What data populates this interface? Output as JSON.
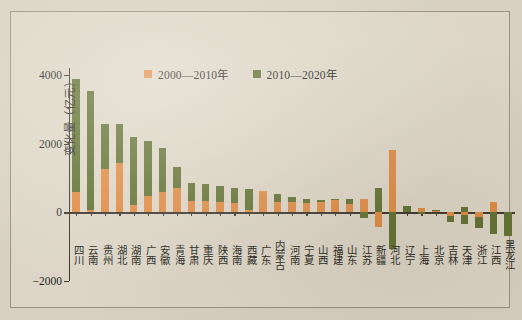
{
  "figure": {
    "background_color": "#ddd6c8",
    "orange": "#e08a42",
    "green": "#5f7031",
    "axis_color": "#3a352d"
  },
  "legend": {
    "position": "top-center",
    "items": [
      {
        "label": "2000—2010年",
        "color": "#e08a42",
        "swatch": "square-swatch"
      },
      {
        "label": "2010—2020年",
        "color": "#5f7031",
        "swatch": "square-swatch"
      }
    ]
  },
  "yaxis": {
    "label": "变化量（亿元）",
    "ticks": [
      "4000",
      "2000",
      "0",
      "-2000"
    ],
    "tick_values": [
      4000,
      2000,
      0,
      -2000
    ],
    "min": -2000,
    "max": 4200
  },
  "chart_data": {
    "type": "bar",
    "stacked": true,
    "title": "",
    "subtitle": "",
    "xlabel": "",
    "ylabel": "变化量（亿元）",
    "ylim": [
      -2000,
      4200
    ],
    "yticks": [
      -2000,
      0,
      2000,
      4000
    ],
    "grid": false,
    "legend_position": "top-center",
    "categories": [
      "四川",
      "云南",
      "贵州",
      "湖北",
      "湖南",
      "广西",
      "安徽",
      "青海",
      "甘肃",
      "重庆",
      "陕西",
      "海南",
      "西藏",
      "广东",
      "内蒙古",
      "河南",
      "宁夏",
      "山西",
      "福建",
      "山东",
      "江苏",
      "新疆",
      "河北",
      "辽宁",
      "上海",
      "北京",
      "吉林",
      "天津",
      "浙江",
      "江西",
      "黑龙江"
    ],
    "series": [
      {
        "name": "2000—2010年",
        "color": "#e08a42",
        "values": [
          600,
          80,
          1250,
          1430,
          200,
          480,
          600,
          700,
          330,
          330,
          290,
          260,
          60,
          620,
          310,
          300,
          280,
          310,
          350,
          250,
          390,
          0,
          1810,
          0,
          120,
          40,
          20,
          -80,
          -130,
          310,
          0
        ]
      },
      {
        "name": "2010—2020年",
        "color": "#5f7031",
        "values": [
          3270,
          3460,
          1310,
          1130,
          2000,
          1600,
          1280,
          620,
          860,
          780,
          620,
          330,
          680,
          0,
          220,
          150,
          100,
          40,
          50,
          130,
          -180,
          700,
          -850,
          180,
          -40,
          30,
          -160,
          -250,
          -500,
          -620,
          -540
        ]
      }
    ],
    "negative_values_note": "新疆 green value is positive above axis with additional negative extent; 江苏/河北 show negative green segments below zero"
  },
  "bars": [
    {
      "cat": "四川",
      "pos2000": 600,
      "pos2010": 3270,
      "neg2000": 0,
      "neg2010": 0
    },
    {
      "cat": "云南",
      "pos2000": 80,
      "pos2010": 3460,
      "neg2000": 0,
      "neg2010": 0
    },
    {
      "cat": "贵州",
      "pos2000": 1250,
      "pos2010": 1310,
      "neg2000": 0,
      "neg2010": 0
    },
    {
      "cat": "湖北",
      "pos2000": 1430,
      "pos2010": 1130,
      "neg2000": 0,
      "neg2010": 0
    },
    {
      "cat": "湖南",
      "pos2000": 200,
      "pos2010": 2000,
      "neg2000": 0,
      "neg2010": 0
    },
    {
      "cat": "广西",
      "pos2000": 480,
      "pos2010": 1600,
      "neg2000": 0,
      "neg2010": 0
    },
    {
      "cat": "安徽",
      "pos2000": 600,
      "pos2010": 1280,
      "neg2000": 0,
      "neg2010": 0
    },
    {
      "cat": "青海",
      "pos2000": 700,
      "pos2010": 620,
      "neg2000": 0,
      "neg2010": 0
    },
    {
      "cat": "甘肃",
      "pos2000": 330,
      "pos2010": 520,
      "neg2000": 0,
      "neg2010": 0
    },
    {
      "cat": "重庆",
      "pos2000": 330,
      "pos2010": 480,
      "neg2000": 0,
      "neg2010": 0
    },
    {
      "cat": "陕西",
      "pos2000": 290,
      "pos2010": 480,
      "neg2000": 0,
      "neg2010": 0
    },
    {
      "cat": "海南",
      "pos2000": 260,
      "pos2010": 440,
      "neg2000": 0,
      "neg2010": 0
    },
    {
      "cat": "西藏",
      "pos2000": 60,
      "pos2010": 630,
      "neg2000": 0,
      "neg2010": 0
    },
    {
      "cat": "广东",
      "pos2000": 620,
      "pos2010": 0,
      "neg2000": 0,
      "neg2010": 0
    },
    {
      "cat": "内蒙古",
      "pos2000": 310,
      "pos2010": 220,
      "neg2000": 0,
      "neg2010": 0
    },
    {
      "cat": "河南",
      "pos2000": 300,
      "pos2010": 150,
      "neg2000": 0,
      "neg2010": 0
    },
    {
      "cat": "宁夏",
      "pos2000": 280,
      "pos2010": 100,
      "neg2000": 0,
      "neg2010": 0
    },
    {
      "cat": "山西",
      "pos2000": 310,
      "pos2010": 40,
      "neg2000": 0,
      "neg2010": 0
    },
    {
      "cat": "福建",
      "pos2000": 350,
      "pos2010": 50,
      "neg2000": 0,
      "neg2010": 0
    },
    {
      "cat": "山东",
      "pos2000": 250,
      "pos2010": 130,
      "neg2000": 0,
      "neg2010": 0
    },
    {
      "cat": "江苏",
      "pos2000": 390,
      "pos2010": 0,
      "neg2000": 0,
      "neg2010": -180
    },
    {
      "cat": "新疆",
      "pos2000": 0,
      "pos2010": 700,
      "neg2000": -420,
      "neg2010": 0
    },
    {
      "cat": "河北",
      "pos2000": 1810,
      "pos2010": 0,
      "neg2000": 0,
      "neg2010": -1060
    },
    {
      "cat": "辽宁",
      "pos2000": 0,
      "pos2010": 180,
      "neg2000": 0,
      "neg2010": 0
    },
    {
      "cat": "上海",
      "pos2000": 120,
      "pos2010": 0,
      "neg2000": 0,
      "neg2010": -40
    },
    {
      "cat": "北京",
      "pos2000": 40,
      "pos2010": 30,
      "neg2000": 0,
      "neg2010": 0
    },
    {
      "cat": "吉林",
      "pos2000": 0,
      "pos2010": 0,
      "neg2000": -120,
      "neg2010": -160
    },
    {
      "cat": "天津",
      "pos2000": 0,
      "pos2010": 140,
      "neg2000": -80,
      "neg2010": -250
    },
    {
      "cat": "浙江",
      "pos2000": 0,
      "pos2010": 0,
      "neg2000": -130,
      "neg2010": -320
    },
    {
      "cat": "江西",
      "pos2000": 310,
      "pos2010": 0,
      "neg2000": 0,
      "neg2010": -620
    },
    {
      "cat": "黑龙江",
      "pos2000": 0,
      "pos2010": 0,
      "neg2000": 0,
      "neg2010": -700
    }
  ]
}
